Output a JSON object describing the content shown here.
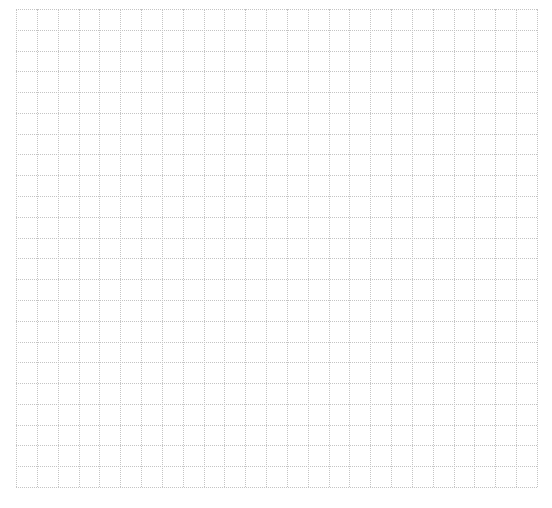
{
  "page": {
    "background": "#ffffff"
  },
  "grid": {
    "columns": 25,
    "rows": 23,
    "line_color": "#c4c4c4",
    "line_style": "dotted",
    "origin_x": 16,
    "origin_y": 9,
    "width": 521,
    "height": 478
  }
}
